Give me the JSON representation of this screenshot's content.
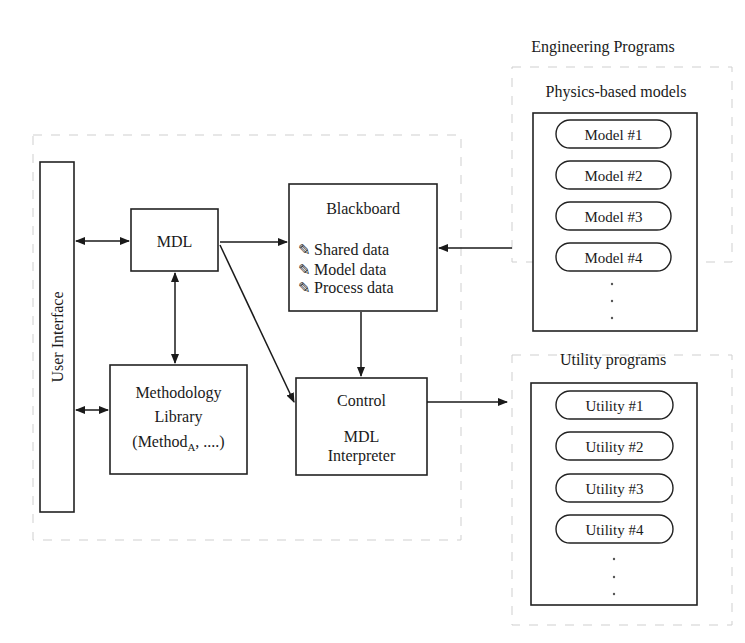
{
  "diagram": {
    "engineering_programs": {
      "title": "Engineering Programs",
      "physics_models": {
        "title": "Physics-based models",
        "items": [
          "Model #1",
          "Model #2",
          "Model #3",
          "Model #4"
        ],
        "more": "·"
      },
      "utility_programs": {
        "title": "Utility programs",
        "items": [
          "Utility #1",
          "Utility #2",
          "Utility #3",
          "Utility #4"
        ],
        "more": "·"
      }
    },
    "user_interface": {
      "label": "User Interface"
    },
    "mdl": {
      "label": "MDL"
    },
    "blackboard": {
      "title": "Blackboard",
      "icon": "✎",
      "items": [
        "Shared data",
        "Model data",
        "Process data"
      ]
    },
    "methodology_library": {
      "line1": "Methodology",
      "line2": "Library",
      "line3_prefix": "(Method",
      "line3_sub": "A",
      "line3_suffix": ", ....)"
    },
    "control": {
      "line1": "Control",
      "line2": "MDL",
      "line3": "Interpreter"
    }
  }
}
